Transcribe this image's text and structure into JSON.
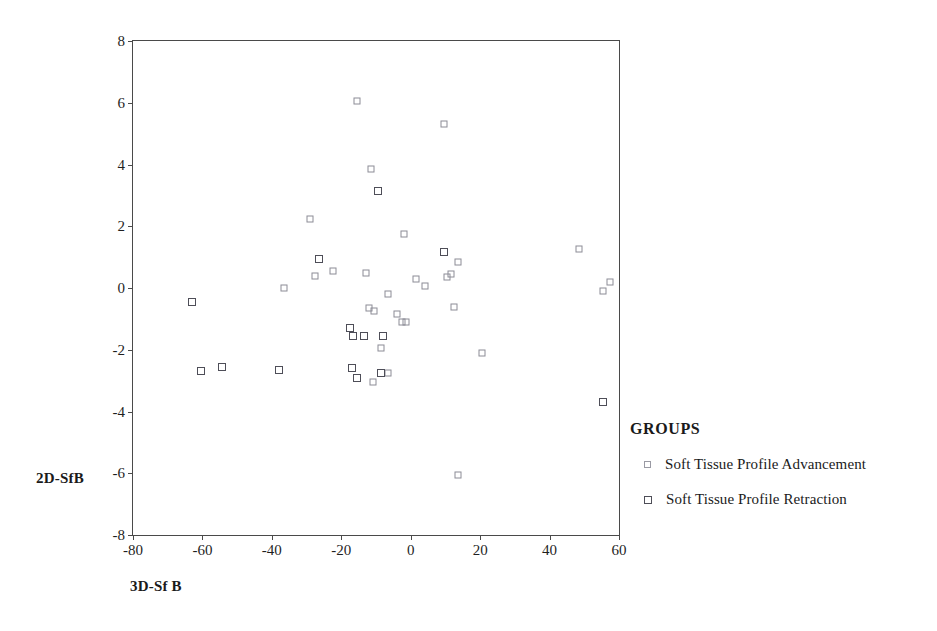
{
  "chart_data": {
    "type": "scatter",
    "title": "",
    "xlabel": "3D-Sf B",
    "ylabel": "2D-SfB",
    "xlim": [
      -80,
      60
    ],
    "ylim": [
      -8,
      8
    ],
    "xticks": [
      "-80",
      "-60",
      "-40",
      "-20",
      "0",
      "20",
      "40",
      "60"
    ],
    "xtick_values": [
      -80,
      -60,
      -40,
      -20,
      0,
      20,
      40,
      60
    ],
    "yticks": [
      "8",
      "6",
      "4",
      "2",
      "0",
      "-2",
      "-4",
      "-6",
      "-8"
    ],
    "ytick_values": [
      8,
      6,
      4,
      2,
      0,
      -2,
      -4,
      -6,
      -8
    ],
    "grid": false,
    "legend_position": "right",
    "legend_title": "GROUPS",
    "series": [
      {
        "name": "Soft Tissue Profile Advancement",
        "marker": "open-square",
        "color": "#8c8c96",
        "points": [
          [
            -29.0,
            2.25
          ],
          [
            -15.5,
            6.05
          ],
          [
            -11.5,
            3.85
          ],
          [
            -27.5,
            0.4
          ],
          [
            -22.5,
            0.55
          ],
          [
            -13.0,
            0.5
          ],
          [
            -12.0,
            -0.65
          ],
          [
            -10.5,
            -0.75
          ],
          [
            -8.5,
            -1.95
          ],
          [
            -6.5,
            -0.2
          ],
          [
            -4.0,
            -0.85
          ],
          [
            -2.5,
            -1.1
          ],
          [
            -6.5,
            -2.75
          ],
          [
            -11.0,
            -3.05
          ],
          [
            -2.0,
            1.75
          ],
          [
            1.5,
            0.3
          ],
          [
            4.0,
            0.05
          ],
          [
            10.5,
            0.35
          ],
          [
            11.5,
            0.45
          ],
          [
            13.5,
            0.85
          ],
          [
            9.5,
            5.3
          ],
          [
            12.5,
            -0.6
          ],
          [
            20.5,
            -2.1
          ],
          [
            48.5,
            1.25
          ],
          [
            55.5,
            -0.1
          ],
          [
            57.5,
            0.2
          ],
          [
            13.5,
            -6.05
          ],
          [
            -36.5,
            0.0
          ],
          [
            -1.5,
            -1.1
          ]
        ]
      },
      {
        "name": "Soft Tissue Profile Retraction",
        "marker": "open-square",
        "color": "#4e4e58",
        "points": [
          [
            -63.0,
            -0.45
          ],
          [
            -60.5,
            -2.7
          ],
          [
            -54.5,
            -2.55
          ],
          [
            -38.0,
            -2.65
          ],
          [
            -26.5,
            0.95
          ],
          [
            -17.5,
            -1.3
          ],
          [
            -16.5,
            -1.55
          ],
          [
            -13.5,
            -1.55
          ],
          [
            -9.5,
            3.15
          ],
          [
            -17.0,
            -2.6
          ],
          [
            -15.5,
            -2.9
          ],
          [
            -8.5,
            -2.75
          ],
          [
            -8.0,
            -1.55
          ],
          [
            9.5,
            1.15
          ],
          [
            55.5,
            -3.7
          ]
        ]
      }
    ]
  },
  "axes": {
    "y_title": "2D-SfB",
    "x_title": "3D-Sf B"
  },
  "legend": {
    "title": "GROUPS",
    "items": [
      {
        "label": "Soft Tissue Profile Advancement",
        "kind": "advancement"
      },
      {
        "label": "Soft Tissue Profile Retraction",
        "kind": "retraction"
      }
    ]
  },
  "colors": {
    "advancement": "#8c8c96",
    "retraction": "#4e4e58",
    "frame": "#4a4a4a",
    "text": "#1a1a1a"
  }
}
